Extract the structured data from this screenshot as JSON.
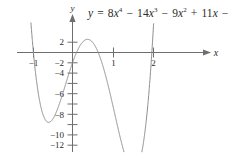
{
  "figure": {
    "equation": "y = 8x^4 - 14x^3 - 9x^2 + 11x - 1",
    "equation_parts": {
      "lhs": "y",
      "equals": "=",
      "t1_coef": "8",
      "t1_var": "x",
      "t1_exp": "4",
      "op1": "−",
      "t2_coef": "14",
      "t2_var": "x",
      "t2_exp": "3",
      "op2": "−",
      "t3_coef": "9",
      "t3_var": "x",
      "t3_exp": "2",
      "op3": "+",
      "t4_coef": "11",
      "t4_var": "x",
      "op4": "−",
      "t5_const": "1"
    },
    "curve_color": "#8a8a8a",
    "axis_color": "#6e6e6e",
    "text_color": "#2b2b2b"
  },
  "chart_data": {
    "type": "line",
    "xlabel": "x",
    "ylabel": "y",
    "xlim": [
      -1.18,
      2.35
    ],
    "ylim": [
      -13.2,
      3.2
    ],
    "grid": false,
    "legend": null,
    "x_ticks": [
      -1,
      1,
      2
    ],
    "x_tick_labels": [
      "−1",
      "1",
      "2"
    ],
    "y_ticks": [
      2,
      -2,
      -4,
      -6,
      -8,
      -10,
      -12
    ],
    "y_tick_labels": [
      "2",
      "−2",
      "−4",
      "−6",
      "−8",
      "−10",
      "−12"
    ],
    "function": "8*x^4 - 14*x^3 - 9*x^2 + 11*x - 1",
    "coefficients": [
      8,
      -14,
      -9,
      11,
      -1
    ],
    "x": [
      -1.12,
      -1.05,
      -1.0,
      -0.95,
      -0.9,
      -0.85,
      -0.8,
      -0.75,
      -0.7,
      -0.65,
      -0.6,
      -0.55,
      -0.5,
      -0.45,
      -0.4,
      -0.35,
      -0.3,
      -0.25,
      -0.2,
      -0.15,
      -0.1,
      -0.05,
      0.0,
      0.05,
      0.1,
      0.15,
      0.2,
      0.25,
      0.3,
      0.35,
      0.4,
      0.45,
      0.5,
      0.55,
      0.6,
      0.65,
      0.7,
      0.75,
      0.8,
      0.85,
      0.9,
      0.95,
      1.0,
      1.05,
      1.1,
      1.15,
      1.2,
      1.25,
      1.3,
      1.35,
      1.4,
      1.45,
      1.5,
      1.55,
      1.6,
      1.65,
      1.7,
      1.75,
      1.8,
      1.85,
      1.9,
      1.95,
      2.0,
      2.05,
      2.1,
      2.12
    ],
    "y": [
      3.6,
      0.79,
      -1.0,
      -2.53,
      -3.83,
      -4.89,
      -5.74,
      -6.38,
      -6.83,
      -7.1,
      -7.19,
      -7.13,
      -6.93,
      -6.59,
      -6.13,
      -5.57,
      -4.91,
      -4.17,
      -3.36,
      -2.49,
      -1.58,
      -0.64,
      1.0,
      0.53,
      1.02,
      1.46,
      1.83,
      2.12,
      2.32,
      2.41,
      2.39,
      2.24,
      1.97,
      1.56,
      1.02,
      0.34,
      -0.48,
      -1.43,
      -2.51,
      -3.7,
      -5.0,
      -6.39,
      -7.83,
      -9.29,
      -10.73,
      -12.09,
      -13.3,
      -14.27,
      -14.91,
      -15.09,
      -14.69,
      -13.56,
      -11.5,
      -8.33,
      -3.81,
      2.33,
      10.39,
      20.65,
      33.46,
      49.2,
      68.32,
      91.3,
      118.72,
      151.2,
      189.43,
      206.0
    ],
    "features": {
      "local_minimum_left": {
        "x": -0.67,
        "y": -7.2
      },
      "local_maximum": {
        "x": 0.37,
        "y": 2.4
      },
      "local_minimum_right": {
        "x": 1.36,
        "y": -11.4
      },
      "x_intercepts_visible": [
        -1.0,
        0.09,
        0.69,
        1.99
      ]
    }
  }
}
